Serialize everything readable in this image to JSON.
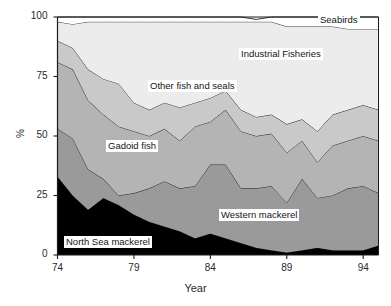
{
  "chart_data": {
    "type": "area",
    "stacked": true,
    "title": "",
    "subtitle": "",
    "xlabel": "Year",
    "ylabel": "%",
    "xlim": [
      74,
      95
    ],
    "ylim": [
      0,
      100
    ],
    "grid": false,
    "legend_position": "inline-annotations",
    "x": [
      74,
      75,
      76,
      77,
      78,
      79,
      80,
      81,
      82,
      83,
      84,
      85,
      86,
      87,
      88,
      89,
      90,
      91,
      92,
      93,
      94,
      95
    ],
    "xticks": [
      "74",
      "79",
      "84",
      "89",
      "94"
    ],
    "xtick_values": [
      74,
      79,
      84,
      89,
      94
    ],
    "yticks": [
      "0",
      "25",
      "50",
      "75",
      "100"
    ],
    "ytick_values": [
      0,
      25,
      50,
      75,
      100
    ],
    "series": [
      {
        "name": "North Sea mackerel",
        "color": "#000000",
        "values": [
          33,
          25,
          19,
          24,
          21,
          17,
          14,
          12,
          10,
          7,
          9,
          7,
          5,
          3,
          2,
          1,
          2,
          3,
          2,
          2,
          2,
          4
        ]
      },
      {
        "name": "Western mackerel",
        "color": "#9a9a9a",
        "values": [
          20,
          24,
          17,
          8,
          4,
          9,
          14,
          19,
          18,
          22,
          29,
          31,
          23,
          25,
          27,
          21,
          30,
          21,
          23,
          26,
          27,
          22
        ]
      },
      {
        "name": "Gadoid fish",
        "color": "#b4b4b4",
        "values": [
          28,
          29,
          29,
          27,
          29,
          26,
          22,
          22,
          20,
          25,
          18,
          23,
          24,
          22,
          22,
          21,
          16,
          15,
          21,
          20,
          21,
          22
        ]
      },
      {
        "name": "Other fish and seals",
        "color": "#c9c9c9",
        "values": [
          9,
          9,
          13,
          15,
          18,
          12,
          11,
          11,
          14,
          10,
          10,
          8,
          9,
          8,
          8,
          12,
          9,
          13,
          13,
          13,
          13,
          13
        ]
      },
      {
        "name": "Industrial Fisheries",
        "color": "#ececec",
        "values": [
          8,
          10,
          20,
          24,
          26,
          34,
          37,
          34,
          36,
          34,
          32,
          29,
          37,
          40,
          39,
          41,
          39,
          44,
          37,
          34,
          32,
          34
        ]
      },
      {
        "name": "Seabirds",
        "color": "#ffffff",
        "values": [
          2,
          3,
          2,
          2,
          2,
          2,
          2,
          2,
          2,
          2,
          2,
          2,
          2,
          1,
          2,
          4,
          4,
          4,
          4,
          5,
          5,
          5
        ]
      }
    ],
    "annotations": [
      {
        "text": "Seabirds",
        "x_px": 318,
        "y_px": 14,
        "boxed": true
      },
      {
        "text": "Industrial Fisheries",
        "x_px": 239,
        "y_px": 48,
        "boxed": true
      },
      {
        "text": "Other fish and seals",
        "x_px": 148,
        "y_px": 80,
        "boxed": true
      },
      {
        "text": "Gadoid fish",
        "x_px": 106,
        "y_px": 140,
        "boxed": true
      },
      {
        "text": "Western mackerel",
        "x_px": 219,
        "y_px": 209,
        "boxed": true
      },
      {
        "text": "North Sea mackerel",
        "x_px": 64,
        "y_px": 236,
        "boxed": true
      }
    ]
  },
  "axes": {
    "ylabel": "%",
    "xlabel": "Year",
    "ytick_labels": [
      "100",
      "75",
      "50",
      "25",
      "0"
    ],
    "xtick_labels": [
      "74",
      "79",
      "84",
      "89",
      "94"
    ]
  }
}
